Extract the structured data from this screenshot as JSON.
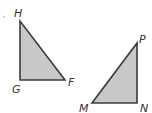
{
  "diagram": {
    "fill_color": "#c8c8c8",
    "stroke_color": "#3a3a3a",
    "triangles": [
      {
        "name": "triangle-HGF",
        "vertices": [
          {
            "label": "H",
            "x": 20,
            "y": 21
          },
          {
            "label": "G",
            "x": 20,
            "y": 80
          },
          {
            "label": "F",
            "x": 65,
            "y": 80
          }
        ]
      },
      {
        "name": "triangle-PMN",
        "vertices": [
          {
            "label": "P",
            "x": 137,
            "y": 43
          },
          {
            "label": "M",
            "x": 92,
            "y": 103
          },
          {
            "label": "N",
            "x": 137,
            "y": 103
          }
        ]
      }
    ],
    "labels": {
      "H": "H",
      "G": "G",
      "F": "F",
      "P": "P",
      "M": "M",
      "N": "N"
    }
  }
}
